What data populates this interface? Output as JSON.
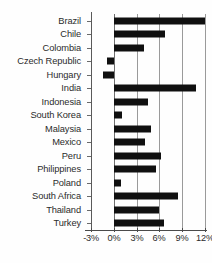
{
  "chart_data": {
    "type": "bar",
    "orientation": "horizontal",
    "title": "",
    "subtitle": "",
    "xlabel": "",
    "ylabel": "",
    "xlim": [
      -3,
      12
    ],
    "xticks": [
      -3,
      0,
      3,
      6,
      9,
      12
    ],
    "xtick_labels": [
      "-3%",
      "0%",
      "3%",
      "6%",
      "9%",
      "12%"
    ],
    "grid": true,
    "legend": null,
    "categories": [
      "Brazil",
      "Chile",
      "Colombia",
      "Czech Republic",
      "Hungary",
      "India",
      "Indonesia",
      "South Korea",
      "Malaysia",
      "Mexico",
      "Peru",
      "Philippines",
      "Poland",
      "South Africa",
      "Thailand",
      "Turkey"
    ],
    "values": [
      12.0,
      6.7,
      4.0,
      -0.9,
      -1.4,
      10.8,
      4.5,
      1.1,
      4.9,
      4.1,
      6.2,
      5.5,
      0.9,
      8.4,
      5.9,
      6.6
    ],
    "bar_color": "#101010",
    "gridline_color": "#9a9a9a",
    "axis_color": "#4a4a4a"
  }
}
